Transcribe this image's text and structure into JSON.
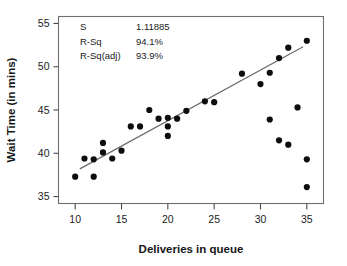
{
  "chart_data": {
    "type": "scatter",
    "title": "",
    "xlabel": "Deliveries in queue",
    "ylabel": "Wait Time (in mins)",
    "xlim": [
      8.2,
      36.8
    ],
    "ylim": [
      34.2,
      55.8
    ],
    "xticks": [
      10,
      15,
      20,
      25,
      30,
      35
    ],
    "yticks": [
      35,
      40,
      45,
      50,
      55
    ],
    "xtick_labels": [
      "10",
      "15",
      "20",
      "25",
      "30",
      "35"
    ],
    "ytick_labels": [
      "35",
      "40",
      "45",
      "50",
      "55"
    ],
    "grid": false,
    "legend": false,
    "point_color": "#0d0d0d",
    "line_color": "#6b6b6b",
    "frame_color": "#6f6f6f",
    "x": [
      10,
      11,
      12,
      12,
      13,
      13,
      14,
      15,
      16,
      17,
      18,
      19,
      20,
      20,
      20,
      21,
      22,
      24,
      25,
      28,
      30,
      31,
      31,
      32,
      32,
      33,
      33,
      34,
      35,
      35,
      35
    ],
    "y": [
      37.3,
      39.4,
      37.3,
      39.3,
      41.2,
      40.1,
      39.4,
      40.3,
      43.1,
      43.1,
      45.0,
      44.0,
      44.1,
      43.1,
      42.0,
      44.0,
      44.9,
      46.0,
      45.9,
      49.2,
      48.0,
      49.3,
      43.9,
      51.0,
      41.5,
      52.2,
      41.0,
      45.3,
      53.0,
      39.3,
      36.1
    ],
    "points": [
      {
        "x": 10,
        "y": 37.3
      },
      {
        "x": 11,
        "y": 39.4
      },
      {
        "x": 12,
        "y": 37.3
      },
      {
        "x": 12,
        "y": 39.3
      },
      {
        "x": 13,
        "y": 41.2
      },
      {
        "x": 13,
        "y": 40.1
      },
      {
        "x": 14,
        "y": 39.4
      },
      {
        "x": 15,
        "y": 40.3
      },
      {
        "x": 16,
        "y": 43.1
      },
      {
        "x": 17,
        "y": 43.1
      },
      {
        "x": 18,
        "y": 45.0
      },
      {
        "x": 19,
        "y": 44.0
      },
      {
        "x": 20,
        "y": 44.1
      },
      {
        "x": 20,
        "y": 43.1
      },
      {
        "x": 20,
        "y": 42.0
      },
      {
        "x": 21,
        "y": 44.0
      },
      {
        "x": 22,
        "y": 44.9
      },
      {
        "x": 24,
        "y": 46.0
      },
      {
        "x": 25,
        "y": 45.9
      },
      {
        "x": 28,
        "y": 49.2
      },
      {
        "x": 30,
        "y": 48.0
      },
      {
        "x": 31,
        "y": 49.3
      },
      {
        "x": 31,
        "y": 43.9
      },
      {
        "x": 32,
        "y": 51.0
      },
      {
        "x": 32,
        "y": 41.5
      },
      {
        "x": 33,
        "y": 52.2
      },
      {
        "x": 33,
        "y": 41.0
      },
      {
        "x": 34,
        "y": 45.3
      },
      {
        "x": 35,
        "y": 53.0
      },
      {
        "x": 35,
        "y": 39.3
      },
      {
        "x": 35,
        "y": 36.1
      }
    ],
    "fit_line": {
      "x_start": 10.5,
      "y_start": 38.2,
      "x_end": 34.6,
      "y_end": 52.3
    },
    "annotations": [
      {
        "label": "S",
        "value": "1.11885"
      },
      {
        "label": "R-Sq",
        "value": "94.1%"
      },
      {
        "label": "R-Sq(adj)",
        "value": "93.9%"
      }
    ]
  }
}
